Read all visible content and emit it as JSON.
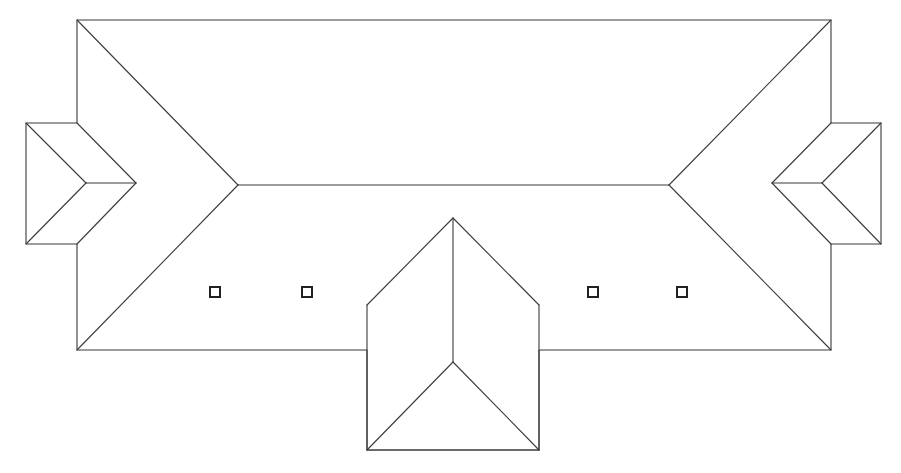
{
  "diagram": {
    "type": "roof-plan",
    "background": "#ffffff",
    "stroke_color": "#3a3a3a",
    "skylight_color": "#222222",
    "stroke_width": 1.1,
    "outline": [
      [
        77,
        20
      ],
      [
        831,
        20
      ],
      [
        831,
        123
      ],
      [
        881,
        123
      ],
      [
        881,
        244
      ],
      [
        831,
        244
      ],
      [
        831,
        350
      ],
      [
        539,
        350
      ],
      [
        539,
        450
      ],
      [
        367,
        450
      ],
      [
        367,
        350
      ],
      [
        77,
        350
      ],
      [
        77,
        244
      ],
      [
        26,
        244
      ],
      [
        26,
        123
      ],
      [
        77,
        123
      ]
    ],
    "main_roof": {
      "ridge": [
        [
          238,
          185
        ],
        [
          669,
          185
        ]
      ],
      "hips": [
        [
          [
            77,
            20
          ],
          [
            238,
            185
          ]
        ],
        [
          [
            831,
            20
          ],
          [
            669,
            185
          ]
        ],
        [
          [
            238,
            185
          ],
          [
            77,
            350
          ]
        ],
        [
          [
            669,
            185
          ],
          [
            831,
            350
          ]
        ]
      ]
    },
    "left_wing": {
      "box": [
        [
          26,
          123
        ],
        [
          77,
          123
        ],
        [
          77,
          244
        ],
        [
          26,
          244
        ]
      ],
      "lines": [
        [
          [
            77,
            123
          ],
          [
            136,
            183
          ]
        ],
        [
          [
            136,
            183
          ],
          [
            77,
            244
          ]
        ],
        [
          [
            26,
            123
          ],
          [
            86,
            183
          ]
        ],
        [
          [
            86,
            183
          ],
          [
            26,
            244
          ]
        ],
        [
          [
            86,
            183
          ],
          [
            136,
            183
          ]
        ]
      ]
    },
    "right_wing": {
      "lines": [
        [
          [
            831,
            123
          ],
          [
            772,
            183
          ]
        ],
        [
          [
            772,
            183
          ],
          [
            831,
            244
          ]
        ],
        [
          [
            881,
            123
          ],
          [
            822,
            183
          ]
        ],
        [
          [
            822,
            183
          ],
          [
            881,
            244
          ]
        ],
        [
          [
            772,
            183
          ],
          [
            822,
            183
          ]
        ]
      ]
    },
    "front_gable": {
      "lines": [
        [
          [
            453,
            218
          ],
          [
            367,
            305
          ]
        ],
        [
          [
            453,
            218
          ],
          [
            539,
            305
          ]
        ],
        [
          [
            367,
            305
          ],
          [
            367,
            450
          ]
        ],
        [
          [
            539,
            305
          ],
          [
            539,
            450
          ]
        ],
        [
          [
            367,
            450
          ],
          [
            539,
            450
          ]
        ],
        [
          [
            453,
            218
          ],
          [
            453,
            362
          ]
        ],
        [
          [
            453,
            362
          ],
          [
            367,
            450
          ]
        ],
        [
          [
            453,
            362
          ],
          [
            539,
            450
          ]
        ]
      ]
    },
    "skylights": [
      {
        "x": 210,
        "y": 287,
        "size": 10
      },
      {
        "x": 302,
        "y": 287,
        "size": 10
      },
      {
        "x": 588,
        "y": 287,
        "size": 10
      },
      {
        "x": 677,
        "y": 287,
        "size": 10
      }
    ]
  }
}
